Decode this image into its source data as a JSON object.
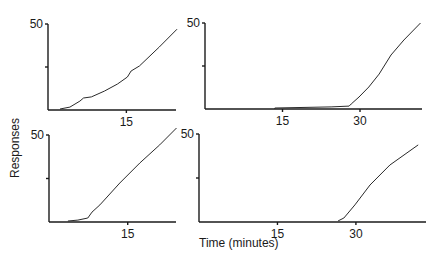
{
  "chart_data": {
    "type": "line",
    "xlabel": "Time (minutes)",
    "ylabel": "Responses",
    "grid": false,
    "legend": "none",
    "panels": [
      {
        "name": "top-left",
        "xlim": [
          0,
          24.5
        ],
        "ylim": [
          0,
          50
        ],
        "xticks": [
          15
        ],
        "yticks": [
          25,
          50
        ],
        "ytick_labels": [
          "",
          "50"
        ],
        "xtick_labels": [
          "15"
        ],
        "series": [
          {
            "name": "cumulative responses",
            "x": [
              2.3,
              4.2,
              6.1,
              6.8,
              8.3,
              10.8,
              13.3,
              15.2,
              15.9,
              17.5,
              21.3,
              24.7
            ],
            "y": [
              0.6,
              1.7,
              5.2,
              7,
              7.6,
              11,
              15.1,
              19.2,
              22.7,
              25.6,
              36.6,
              47
            ]
          }
        ]
      },
      {
        "name": "top-right",
        "xlim": [
          0,
          42
        ],
        "ylim": [
          0,
          50
        ],
        "xticks": [
          15,
          30
        ],
        "yticks": [
          25,
          50
        ],
        "ytick_labels": [
          "",
          "50"
        ],
        "xtick_labels": [
          "15",
          "30"
        ],
        "series": [
          {
            "name": "cumulative responses",
            "x": [
              13.5,
              13.5,
              24.4,
              27.9,
              28.3,
              29.8,
              31.7,
              33.7,
              36,
              38.5,
              41.7
            ],
            "y": [
              0,
              0.6,
              1.2,
              1.7,
              2.9,
              7,
              12.8,
              20.3,
              31.4,
              40.1,
              50
            ]
          }
        ]
      },
      {
        "name": "bottom-left",
        "xlim": [
          0,
          24.2
        ],
        "ylim": [
          0,
          50
        ],
        "xticks": [
          15
        ],
        "yticks": [
          25,
          50
        ],
        "ytick_labels": [
          "",
          "50"
        ],
        "xtick_labels": [
          "15"
        ],
        "series": [
          {
            "name": "cumulative responses",
            "x": [
              3.6,
              5.5,
              7.4,
              8.2,
              9.7,
              13.5,
              17.3,
              21.1,
              24.3
            ],
            "y": [
              0.6,
              1.1,
              2.3,
              5.7,
              9.8,
              22.4,
              33.9,
              44.3,
              54
            ]
          }
        ]
      },
      {
        "name": "bottom-right",
        "xlim": [
          0,
          43.4
        ],
        "ylim": [
          0,
          50
        ],
        "xticks": [
          15,
          30
        ],
        "yticks": [
          25,
          50
        ],
        "ytick_labels": [
          "",
          "50"
        ],
        "xtick_labels": [
          "15",
          "30"
        ],
        "series": [
          {
            "name": "cumulative responses",
            "x": [
              26.6,
              27.7,
              29.8,
              32.7,
              36.5,
              41.9
            ],
            "y": [
              0.6,
              2.3,
              9.7,
              21,
              32.4,
              43.8
            ]
          }
        ]
      }
    ]
  }
}
